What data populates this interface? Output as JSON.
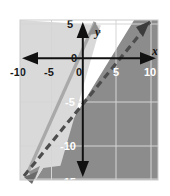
{
  "figure": {
    "kind": "coordinate-plane-inequality-graph",
    "background_color": "#ffffff",
    "frame": {
      "x": 20,
      "y": 20,
      "width": 138,
      "height": 160,
      "border_color": "#c9c9c9"
    }
  },
  "axes": {
    "x_label": "x",
    "y_label": "y",
    "axis_color": "#111111",
    "origin_label": "0",
    "x_ticks": [
      "-10",
      "-5",
      "0",
      "5",
      "10"
    ],
    "x_tick_values": [
      -10,
      -5,
      0,
      5,
      10
    ],
    "y_ticks": [
      "5",
      "0",
      "-5",
      "-10",
      "-15"
    ],
    "y_tick_values": [
      5,
      0,
      -5,
      -10,
      -15
    ],
    "xlim": [
      -11,
      10.5
    ],
    "ylim": [
      -16,
      5.5
    ],
    "grid": true,
    "grid_color": "#d8d8d8",
    "grid_step": 5
  },
  "shading": {
    "outer_fill_color": "#8c8c8c",
    "between_fill_color": "#d9d9d9",
    "outer_label": "dark shaded region",
    "between_label": "light shaded wedge"
  },
  "chart_data": {
    "type": "line",
    "title": "",
    "xlabel": "x",
    "ylabel": "y",
    "xlim": [
      -11,
      10.5
    ],
    "ylim": [
      -16,
      5.5
    ],
    "grid": true,
    "legend": "none",
    "series": [
      {
        "name": "boundary-line-solid",
        "style": "solid",
        "color": "#a8a8a8",
        "slope": 3,
        "intercept": 0,
        "equation": "y = 3x",
        "points": [
          [
            -4.7,
            -14.1
          ],
          [
            1.6,
            4.8
          ]
        ],
        "arrows": "both"
      },
      {
        "name": "boundary-line-dashed",
        "style": "dashed",
        "color": "#4a4a4a",
        "slope": 1.4,
        "intercept": -4,
        "equation": "y = 1.4x - 4",
        "points": [
          [
            -7.4,
            -14.4
          ],
          [
            8.4,
            7.8
          ]
        ],
        "arrows": "both"
      }
    ]
  }
}
